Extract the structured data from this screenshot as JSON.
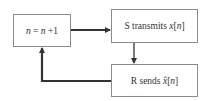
{
  "diagram": {
    "type": "flowchart-loop",
    "nodes": [
      {
        "id": "update",
        "label": "n = n +1",
        "parts": {
          "var": "n",
          "eq": " = ",
          "var2": "n",
          "rest": " +1"
        }
      },
      {
        "id": "transmit",
        "label": "S transmits x[n]",
        "parts": {
          "prefix": "S transmits ",
          "sym": "x",
          "open": "[",
          "idx": "n",
          "close": "]"
        }
      },
      {
        "id": "send",
        "label": "R sends x̂[n]",
        "parts": {
          "prefix": "R sends ",
          "sym": "x̂",
          "open": "[",
          "idx": "n",
          "close": "]"
        }
      }
    ],
    "edges": [
      {
        "from": "update",
        "to": "transmit"
      },
      {
        "from": "transmit",
        "to": "send"
      },
      {
        "from": "send",
        "to": "update"
      }
    ],
    "colors": {
      "arrow": "#333333",
      "box_border": "#8a8a8a",
      "text": "#333333"
    }
  }
}
